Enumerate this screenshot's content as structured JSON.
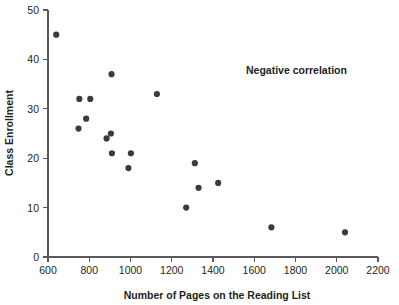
{
  "chart_data": {
    "type": "scatter",
    "title": "",
    "xlabel": "Number of Pages on the Reading List",
    "ylabel": "Class Enrollment",
    "xlim": [
      600,
      2200
    ],
    "ylim": [
      0,
      50
    ],
    "xticks": [
      600,
      800,
      1000,
      1200,
      1400,
      1600,
      1800,
      2000,
      2200
    ],
    "xtick_labels": [
      "600",
      "800",
      "1000",
      "1200",
      "1400",
      "1600",
      "1800",
      "2000",
      "2200"
    ],
    "yticks": [
      0,
      10,
      20,
      30,
      40,
      50
    ],
    "ytick_labels": [
      "0",
      "10",
      "20",
      "30",
      "40",
      "50"
    ],
    "grid": false,
    "legend": null,
    "marker_color": "#3b3b3d",
    "axis_color": "#58595b",
    "series": [
      {
        "name": "Class enrollment vs pages",
        "points": [
          {
            "x": 640,
            "y": 45
          },
          {
            "x": 748,
            "y": 26
          },
          {
            "x": 752,
            "y": 32
          },
          {
            "x": 785,
            "y": 28
          },
          {
            "x": 805,
            "y": 32
          },
          {
            "x": 884,
            "y": 24
          },
          {
            "x": 905,
            "y": 25
          },
          {
            "x": 908,
            "y": 37
          },
          {
            "x": 910,
            "y": 21
          },
          {
            "x": 990,
            "y": 18
          },
          {
            "x": 1002,
            "y": 21
          },
          {
            "x": 1128,
            "y": 33
          },
          {
            "x": 1270,
            "y": 10
          },
          {
            "x": 1312,
            "y": 19
          },
          {
            "x": 1330,
            "y": 14
          },
          {
            "x": 1425,
            "y": 15
          },
          {
            "x": 1683,
            "y": 6
          },
          {
            "x": 2040,
            "y": 5
          }
        ]
      }
    ],
    "annotations": [
      {
        "text": "Negative correlation",
        "x": 1560,
        "y": 37
      }
    ]
  }
}
